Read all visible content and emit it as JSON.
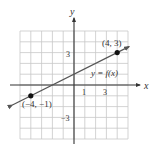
{
  "chart_data": {
    "type": "line",
    "title": "",
    "xlabel": "x",
    "ylabel": "y",
    "xlim": [
      -5,
      5
    ],
    "ylim": [
      -5,
      5
    ],
    "grid": true,
    "x_ticks_labeled": [
      {
        "value": 1,
        "label": "1"
      },
      {
        "value": 3,
        "label": "3"
      }
    ],
    "y_ticks_labeled": [
      {
        "value": 3,
        "label": "3"
      },
      {
        "value": -3,
        "label": "-3"
      }
    ],
    "series": [
      {
        "name": "y = f(x)",
        "x": [
          -4,
          4
        ],
        "y": [
          -1,
          3
        ],
        "slope": 0.5,
        "intercept": 1
      }
    ],
    "points": [
      {
        "x": -4,
        "y": -1,
        "label": "(−4, −1)"
      },
      {
        "x": 4,
        "y": 3,
        "label": "(4, 3)"
      }
    ],
    "annotations": [
      {
        "text": "y = f(x)"
      }
    ]
  },
  "labels": {
    "x_axis": "x",
    "y_axis": "y",
    "x_tick_1": "1",
    "x_tick_3": "3",
    "y_tick_3": "3",
    "y_tick_neg3": "−3",
    "point_a": "(−4, −1)",
    "point_b": "(4, 3)",
    "function": "y = f(x)"
  },
  "colors": {
    "grid": "#c8c8c8",
    "axis": "#333333",
    "line": "#555555",
    "point": "#111111"
  }
}
